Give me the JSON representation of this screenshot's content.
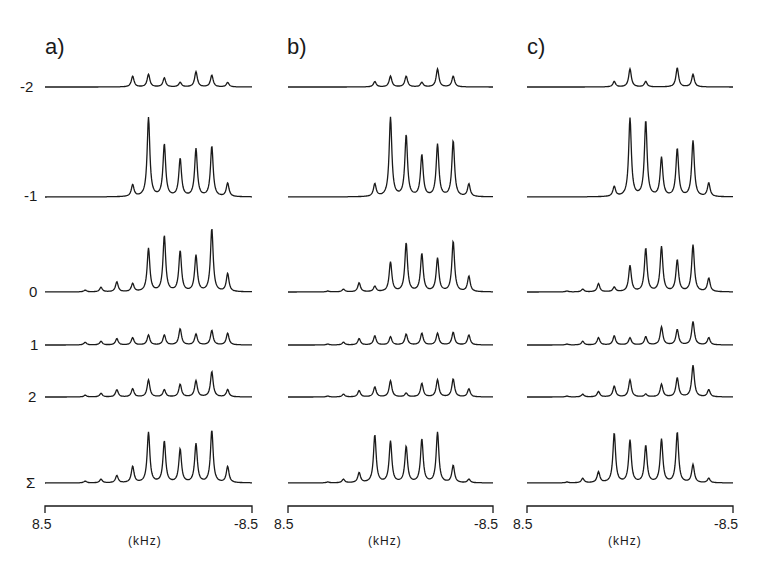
{
  "chart_data": {
    "type": "line",
    "rows": [
      "-2",
      "-1",
      "0",
      "1",
      "2",
      "Σ"
    ],
    "xlabel": "(kHz)",
    "xlim": [
      8.5,
      -8.5
    ],
    "x_tick_labels": [
      "8.5",
      "-8.5"
    ],
    "peak_positions_khz": [
      5.2,
      3.9,
      2.6,
      1.3,
      0.0,
      -1.3,
      -2.6,
      -3.9,
      -5.2,
      -6.5
    ],
    "panels": [
      {
        "title": "a)",
        "series": [
          {
            "name": "-2",
            "values": [
              0,
              0,
              0,
              0.12,
              0.14,
              0.1,
              0.05,
              0.17,
              0.13,
              0.05
            ]
          },
          {
            "name": "-1",
            "values": [
              0,
              0,
              0,
              0.13,
              0.88,
              0.58,
              0.42,
              0.53,
              0.56,
              0.15
            ]
          },
          {
            "name": "0",
            "values": [
              0.02,
              0.05,
              0.11,
              0.09,
              0.48,
              0.62,
              0.45,
              0.4,
              0.7,
              0.2
            ]
          },
          {
            "name": "1",
            "values": [
              0.03,
              0.04,
              0.07,
              0.08,
              0.11,
              0.11,
              0.18,
              0.12,
              0.16,
              0.13
            ]
          },
          {
            "name": "2",
            "values": [
              0.02,
              0.04,
              0.08,
              0.09,
              0.19,
              0.08,
              0.14,
              0.18,
              0.28,
              0.08
            ]
          },
          {
            "name": "Σ",
            "values": [
              0.02,
              0.04,
              0.08,
              0.18,
              0.56,
              0.46,
              0.37,
              0.43,
              0.58,
              0.18
            ]
          }
        ]
      },
      {
        "title": "b)",
        "series": [
          {
            "name": "-2",
            "values": [
              0,
              0,
              0,
              0.06,
              0.12,
              0.12,
              0.05,
              0.2,
              0.12,
              0
            ]
          },
          {
            "name": "-1",
            "values": [
              0,
              0,
              0,
              0.14,
              0.88,
              0.68,
              0.46,
              0.58,
              0.62,
              0.14
            ]
          },
          {
            "name": "0",
            "values": [
              0.01,
              0.03,
              0.1,
              0.06,
              0.33,
              0.54,
              0.42,
              0.37,
              0.56,
              0.17
            ]
          },
          {
            "name": "1",
            "values": [
              0.01,
              0.03,
              0.07,
              0.1,
              0.09,
              0.12,
              0.13,
              0.13,
              0.14,
              0.11
            ]
          },
          {
            "name": "2",
            "values": [
              0.01,
              0.03,
              0.07,
              0.11,
              0.18,
              0.04,
              0.15,
              0.19,
              0.2,
              0.09
            ]
          },
          {
            "name": "Σ",
            "values": [
              0.01,
              0.04,
              0.11,
              0.53,
              0.46,
              0.4,
              0.48,
              0.56,
              0.19,
              0.04
            ]
          }
        ]
      },
      {
        "title": "c)",
        "series": [
          {
            "name": "-2",
            "values": [
              0,
              0,
              0,
              0.06,
              0.2,
              0.06,
              0,
              0.21,
              0.14,
              0
            ]
          },
          {
            "name": "-1",
            "values": [
              0,
              0,
              0,
              0.11,
              0.87,
              0.84,
              0.43,
              0.53,
              0.62,
              0.15
            ]
          },
          {
            "name": "0",
            "values": [
              0.01,
              0.03,
              0.09,
              0.05,
              0.29,
              0.48,
              0.5,
              0.35,
              0.52,
              0.15
            ]
          },
          {
            "name": "1",
            "values": [
              0.01,
              0.04,
              0.08,
              0.1,
              0.08,
              0.09,
              0.2,
              0.17,
              0.26,
              0.08
            ]
          },
          {
            "name": "2",
            "values": [
              0.01,
              0.03,
              0.06,
              0.12,
              0.19,
              0.03,
              0.14,
              0.21,
              0.35,
              0.08
            ]
          },
          {
            "name": "Σ",
            "values": [
              0.01,
              0.05,
              0.12,
              0.55,
              0.47,
              0.41,
              0.48,
              0.56,
              0.2,
              0.05
            ]
          }
        ]
      }
    ]
  },
  "labels": {
    "panel_a": "a)",
    "panel_b": "b)",
    "panel_c": "c)",
    "row_m2": "-2",
    "row_m1": "-1",
    "row_0": "0",
    "row_1": "1",
    "row_2": "2",
    "row_sum": "Σ",
    "tick_left": "8.5",
    "tick_right": "-8.5",
    "unit": "(kHz)"
  }
}
